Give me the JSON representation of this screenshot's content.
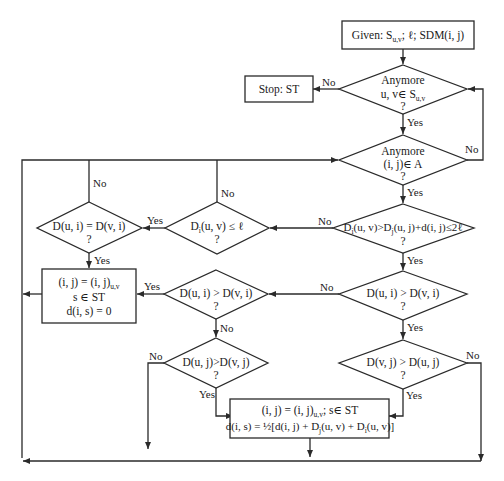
{
  "diagram": {
    "type": "flowchart",
    "start": {
      "text": "Given: S",
      "sub": "u,v",
      "rest": "; ℓ; SDM(i, j)"
    },
    "stop": {
      "text": "Stop: ST"
    },
    "d1": {
      "line1": "Anymore",
      "line2": "u, v∈ S",
      "sub": "u,v",
      "q": "?"
    },
    "d2": {
      "line1": "Anymore",
      "line2": "(i, j)∈ A",
      "q": "?"
    },
    "d3": {
      "pre": "D",
      "s1": "i",
      "a": "(u, v)>D",
      "s2": "j",
      "b": "(u, j)+d(i, j)≤2ℓ",
      "q": "?"
    },
    "d4": {
      "pre": "D",
      "s1": "i",
      "a": "(u, v) ≤ ℓ",
      "q": "?"
    },
    "d5": {
      "text": "D(u, i) = D(v, i)",
      "q": "?"
    },
    "d6": {
      "text": "D(u, i) > D(v, i)",
      "q": "?"
    },
    "d7": {
      "text": "D(u, i) > D(v, i)",
      "q": "?"
    },
    "d8": {
      "text": "D(u, j)>D(v, j)",
      "q": "?"
    },
    "d9": {
      "text": "D(v, j) > D(u, j)",
      "q": "?"
    },
    "box1": {
      "line1a": "(i, j) = (i, j)",
      "line1sub": "u,v",
      "line2": "s ∈ ST",
      "line3": "d(i, s) = 0"
    },
    "box2": {
      "line1a": "(i, j) = (i, j)",
      "line1sub": "u,v",
      "line1b": "; s∈  ST",
      "line2a": "d(i, s) = ½[d(i, j) + D",
      "s1": "j",
      "line2b": "(u, v) + D",
      "s2": "i",
      "line2c": "(u, v)]"
    },
    "labels": {
      "yes": "Yes",
      "no": "No"
    }
  }
}
